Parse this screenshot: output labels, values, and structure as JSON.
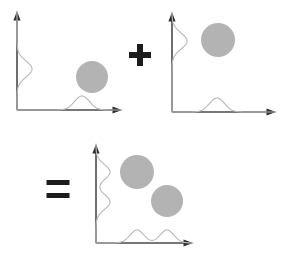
{
  "figure": {
    "width": 286,
    "height": 259,
    "background_color": "#ffffff",
    "axis_color": "#4a4a4a",
    "arrow_color": "#2e2e2e",
    "curve_color": "#b9b9b9",
    "blob_color": "#b3b3b3",
    "operator_color": "#1c1c1c"
  },
  "operators": [
    {
      "name": "plus",
      "symbol": "+",
      "cx": 140,
      "cy": 55,
      "arm_length": 22,
      "thickness": 6
    },
    {
      "name": "equals",
      "symbol": "=",
      "cx": 58,
      "cy": 189,
      "arm_length": 23,
      "thickness": 5,
      "gap": 8
    }
  ],
  "panels": [
    {
      "id": "panel-left",
      "label": "Left operand panel",
      "origin": {
        "x": 17,
        "y": 110
      },
      "x_axis_end": {
        "x": 122,
        "y": 110
      },
      "y_axis_end": {
        "x": 17,
        "y": 11
      },
      "blobs": [
        {
          "cx": 92,
          "cy": 77,
          "r": 16
        }
      ],
      "x_profile": {
        "baseline_y": 110,
        "peaks": [
          {
            "center": 82,
            "height": 14,
            "sigma": 7.5
          }
        ],
        "span": [
          17,
          122
        ]
      },
      "y_profile": {
        "baseline_x": 17,
        "peaks": [
          {
            "center": 69,
            "height": 15,
            "sigma": 8.0
          }
        ],
        "span": [
          11,
          110
        ]
      }
    },
    {
      "id": "panel-right",
      "label": "Right operand panel",
      "origin": {
        "x": 172,
        "y": 112
      },
      "x_axis_end": {
        "x": 276,
        "y": 112
      },
      "y_axis_end": {
        "x": 172,
        "y": 12
      },
      "blobs": [
        {
          "cx": 218,
          "cy": 40,
          "r": 17
        }
      ],
      "x_profile": {
        "baseline_y": 112,
        "peaks": [
          {
            "center": 217,
            "height": 14,
            "sigma": 7.5
          }
        ],
        "span": [
          172,
          276
        ]
      },
      "y_profile": {
        "baseline_x": 172,
        "peaks": [
          {
            "center": 41,
            "height": 15,
            "sigma": 8.0
          }
        ],
        "span": [
          12,
          112
        ]
      }
    },
    {
      "id": "panel-result",
      "label": "Result panel",
      "origin": {
        "x": 96,
        "y": 243
      },
      "x_axis_end": {
        "x": 193,
        "y": 243
      },
      "y_axis_end": {
        "x": 96,
        "y": 144
      },
      "blobs": [
        {
          "cx": 137,
          "cy": 172,
          "r": 17
        },
        {
          "cx": 167,
          "cy": 201,
          "r": 16
        }
      ],
      "x_profile": {
        "baseline_y": 243,
        "peaks": [
          {
            "center": 137,
            "height": 13,
            "sigma": 7.0
          },
          {
            "center": 167,
            "height": 13,
            "sigma": 7.0
          }
        ],
        "span": [
          96,
          193
        ]
      },
      "y_profile": {
        "baseline_x": 96,
        "peaks": [
          {
            "center": 172,
            "height": 14,
            "sigma": 7.5
          },
          {
            "center": 202,
            "height": 14,
            "sigma": 7.5
          }
        ],
        "span": [
          144,
          243
        ]
      }
    }
  ]
}
